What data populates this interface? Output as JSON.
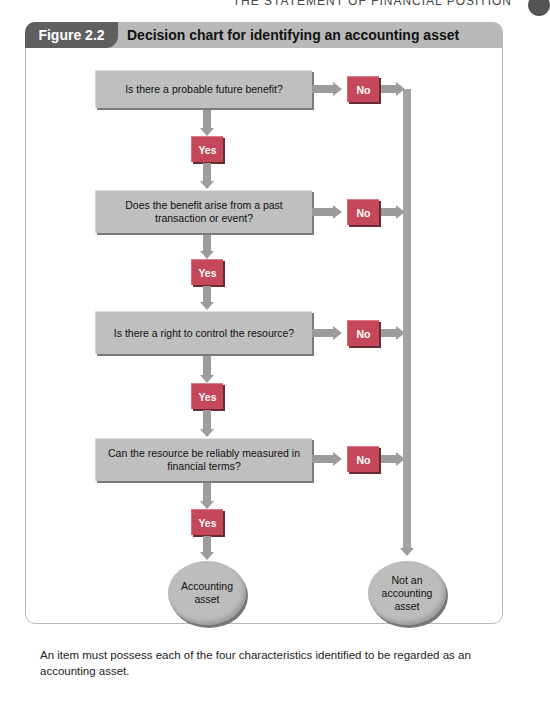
{
  "running_head": "THE STATEMENT OF FINANCIAL POSITION",
  "figure": {
    "label": "Figure 2.2",
    "title": "Decision chart for identifying an accounting asset"
  },
  "questions": [
    {
      "text": "Is there a probable future benefit?"
    },
    {
      "text": "Does the benefit arise from a past transaction or event?"
    },
    {
      "text": "Is there a right to control the resource?"
    },
    {
      "text": "Can the resource be reliably measured in financial terms?"
    }
  ],
  "labels": {
    "yes": "Yes",
    "no": "No"
  },
  "outcomes": {
    "positive": "Accounting asset",
    "negative": "Not an accounting asset"
  },
  "caption": "An item must possess each of the four characteristics identified to be regarded as an accounting asset.",
  "colors": {
    "header_dark": "#5f5f5f",
    "header_light": "#b9b9b9",
    "box": "#bfbfbf",
    "tag": "#c4485a",
    "arrow": "#9c9c9c"
  }
}
